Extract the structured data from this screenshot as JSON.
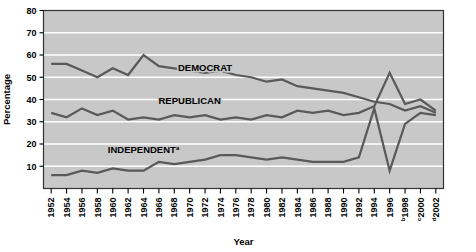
{
  "chart_data": {
    "type": "line",
    "title": "",
    "xlabel": "Year",
    "ylabel": "Percentage",
    "ylim": [
      0,
      80
    ],
    "yticks": [
      0,
      10,
      20,
      30,
      40,
      50,
      60,
      70,
      80
    ],
    "ytick_labels": [
      "",
      "10",
      "20",
      "30",
      "40",
      "50",
      "60",
      "70",
      "80"
    ],
    "grid": "horizontal",
    "legend_position": "inline-on-lines",
    "plot_background": "#c8c8c8",
    "gridline_color": "#ffffff",
    "line_color": "#595959",
    "categories": [
      "1952",
      "1954",
      "1956",
      "1958",
      "1960",
      "1962",
      "1964",
      "1966",
      "1968",
      "1970",
      "1972",
      "1974",
      "1976",
      "1978",
      "1980",
      "1982",
      "1984",
      "1986",
      "1988",
      "1990",
      "1992",
      "1994",
      "1996",
      "1998",
      "2000",
      "2002"
    ],
    "xtick_superscripts": {
      "1998": "b",
      "2000": "c",
      "2002": "d"
    },
    "series": [
      {
        "name": "DEMOCRAT",
        "label": "DEMOCRAT",
        "superscript": "",
        "label_x_year": "1972",
        "label_y_value": 53,
        "values": [
          56,
          56,
          53,
          50,
          54,
          51,
          60,
          55,
          54,
          53,
          52,
          53,
          51,
          50,
          48,
          49,
          46,
          45,
          44,
          43,
          41,
          39,
          38,
          35,
          37,
          34
        ]
      },
      {
        "name": "REPUBLICAN",
        "label": "REPUBLICAN",
        "superscript": "",
        "label_x_year": "1970",
        "label_y_value": 38,
        "values": [
          34,
          32,
          36,
          33,
          35,
          31,
          32,
          31,
          33,
          32,
          33,
          31,
          32,
          31,
          33,
          32,
          35,
          34,
          35,
          33,
          34,
          37,
          52,
          38,
          40,
          35
        ]
      },
      {
        "name": "INDEPENDENT",
        "label": "INDEPENDENT",
        "superscript": "a",
        "label_x_year": "1964",
        "label_y_value": 16,
        "values": [
          6,
          6,
          8,
          7,
          9,
          8,
          8,
          12,
          11,
          12,
          13,
          15,
          15,
          14,
          13,
          14,
          13,
          12,
          12,
          12,
          14,
          36,
          8,
          29,
          34,
          33
        ]
      }
    ]
  },
  "axis": {
    "ylabel": "Percentage",
    "xlabel": "Year"
  }
}
